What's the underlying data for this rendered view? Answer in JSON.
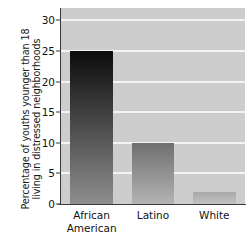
{
  "chart_data": {
    "type": "bar",
    "title": "",
    "subtitle": "",
    "xlabel": "",
    "ylabel_line1": "Percentage of youths younger than 18",
    "ylabel_line2": "living in distressed neighborhoods",
    "categories": [
      "African American",
      "Latino",
      "White"
    ],
    "category_lines": [
      [
        "African",
        "American"
      ],
      [
        "Latino"
      ],
      [
        "White"
      ]
    ],
    "values": [
      25,
      10,
      2
    ],
    "ylim": [
      0,
      32
    ],
    "yticks": [
      0,
      5,
      10,
      15,
      20,
      25,
      30
    ],
    "ytick_labels": [
      "0",
      "5",
      "10",
      "15",
      "20",
      "25",
      "30"
    ],
    "grid": true,
    "grid_axis": "y",
    "legend": null,
    "legend_position": "none",
    "panel_background": "#cdcdcd",
    "gridline_color": "#f4f4f4",
    "axis_color": "#3a3a3a",
    "text_color": "#111111",
    "bar_colors": [
      {
        "top": "#0b0b0b",
        "bottom": "#8e8e8e"
      },
      {
        "top": "#6f6f6f",
        "bottom": "#b4b4b4"
      },
      {
        "top": "#a8a8a8",
        "bottom": "#c2c2c2"
      }
    ]
  }
}
